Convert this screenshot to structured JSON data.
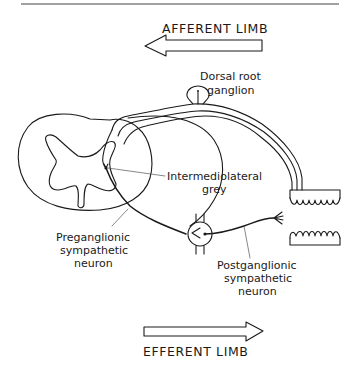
{
  "figure": {
    "type": "reflex-arc-diagram",
    "colors": {
      "ink": "#1a1a1a",
      "background": "#ffffff",
      "leader": "#555555"
    },
    "arrows": {
      "afferent": {
        "label": "AFFERENT LIMB",
        "direction": "left"
      },
      "efferent": {
        "label": "EFFERENT LIMB",
        "direction": "right"
      }
    },
    "labels": {
      "dorsal_root_ganglion": [
        "Dorsal root",
        "ganglion"
      ],
      "intermediolateral_grey": [
        "Intermediolateral",
        "grey"
      ],
      "preganglionic": [
        "Preganglionic",
        "sympathetic",
        "neuron"
      ],
      "postganglionic": [
        "Postganglionic",
        "sympathetic",
        "neuron"
      ]
    },
    "structures": [
      "spinal-cord-cross-section",
      "grey-matter-butterfly",
      "dorsal-root-ganglion",
      "afferent-nerve",
      "sympathetic-ganglion",
      "receptor-epithelium",
      "effector-epithelium"
    ]
  }
}
